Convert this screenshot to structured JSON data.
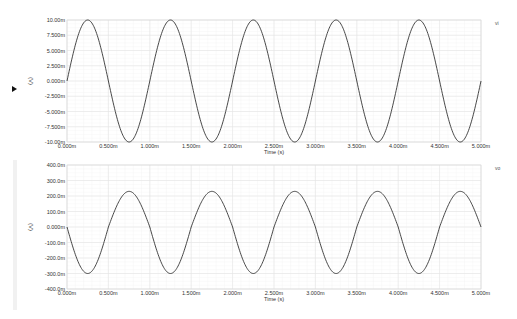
{
  "chart_data": [
    {
      "type": "line",
      "title": "",
      "trace_name": "vi",
      "xlabel": "Time (s)",
      "ylabel": "(V)",
      "xlim": [
        0,
        0.005
      ],
      "ylim": [
        -0.01,
        0.01
      ],
      "x_ticks": [
        "0.000m",
        "0.500m",
        "1.000m",
        "1.500m",
        "2.000m",
        "2.500m",
        "3.000m",
        "3.500m",
        "4.000m",
        "4.500m",
        "5.000m"
      ],
      "y_ticks": [
        "10.00m",
        "7.500m",
        "5.000m",
        "2.500m",
        "0.000m",
        "-2.500m",
        "-5.000m",
        "-7.500m",
        "-10.00m"
      ],
      "grid": true,
      "series": [
        {
          "name": "vi",
          "waveform": "sine",
          "amplitude": 0.01,
          "offset": 0,
          "frequency_hz": 1000,
          "phase_deg": 0,
          "cycles": 5
        }
      ]
    },
    {
      "type": "line",
      "title": "",
      "trace_name": "vo",
      "xlabel": "Time (s)",
      "ylabel": "(V)",
      "xlim": [
        0,
        0.005
      ],
      "ylim": [
        -0.4,
        0.4
      ],
      "x_ticks": [
        "0.000m",
        "0.500m",
        "1.000m",
        "1.500m",
        "2.000m",
        "2.500m",
        "3.000m",
        "3.500m",
        "4.000m",
        "4.500m",
        "5.000m"
      ],
      "y_ticks": [
        "400.0m",
        "300.0m",
        "200.0m",
        "100.0m",
        "0.000m",
        "-100.0m",
        "-200.0m",
        "-300.0m",
        "-400.0m"
      ],
      "grid": true,
      "series": [
        {
          "name": "vo",
          "waveform": "inverted-sine",
          "amplitude": 0.265,
          "offset": -0.035,
          "peak": 0.23,
          "trough": -0.3,
          "frequency_hz": 1000,
          "phase_deg": 180,
          "cycles": 5
        }
      ]
    }
  ],
  "colors": {
    "trace": "#333333",
    "grid": "#e4e4e4",
    "background": "#ffffff"
  }
}
